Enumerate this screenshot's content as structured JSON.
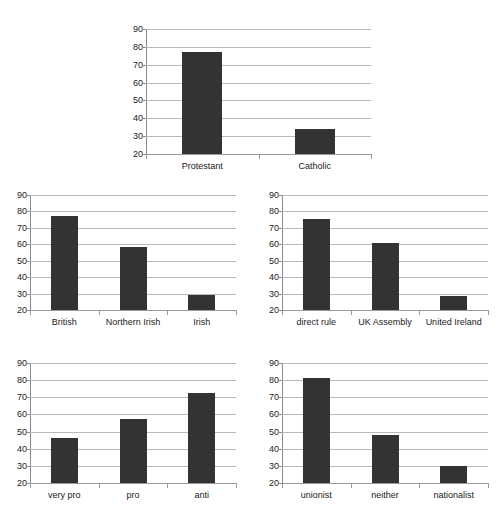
{
  "figure": {
    "background": "#ffffff",
    "bar_color": "#333333",
    "gridline_color": "#b9b9b9",
    "axis_color": "#8a8a8a",
    "panel_count": 5
  },
  "chart_data": [
    {
      "id": "religion",
      "type": "bar",
      "title": "",
      "xlabel": "",
      "ylabel": "",
      "ylim": [
        20,
        90
      ],
      "yticks": [
        20,
        30,
        40,
        50,
        60,
        70,
        80,
        90
      ],
      "grid": true,
      "legend": null,
      "categories": [
        "Protestant",
        "Catholic"
      ],
      "values": [
        77,
        34
      ]
    },
    {
      "id": "national-identity",
      "type": "bar",
      "title": "",
      "xlabel": "",
      "ylabel": "",
      "ylim": [
        20,
        90
      ],
      "yticks": [
        20,
        30,
        40,
        50,
        60,
        70,
        80,
        90
      ],
      "grid": true,
      "legend": null,
      "categories": [
        "British",
        "Northern Irish",
        "Irish"
      ],
      "values": [
        77,
        58.5,
        29
      ]
    },
    {
      "id": "constitutional-preference",
      "type": "bar",
      "title": "",
      "xlabel": "",
      "ylabel": "",
      "ylim": [
        20,
        90
      ],
      "yticks": [
        20,
        30,
        40,
        50,
        60,
        70,
        80,
        90
      ],
      "grid": true,
      "legend": null,
      "categories": [
        "direct rule",
        "UK Assembly",
        "United Ireland"
      ],
      "values": [
        75.5,
        60.5,
        28.5
      ]
    },
    {
      "id": "agreement-stance",
      "type": "bar",
      "title": "",
      "xlabel": "",
      "ylabel": "",
      "ylim": [
        20,
        90
      ],
      "yticks": [
        20,
        30,
        40,
        50,
        60,
        70,
        80,
        90
      ],
      "grid": true,
      "legend": null,
      "categories": [
        "very pro",
        "pro",
        "anti"
      ],
      "values": [
        46,
        57.5,
        72.5
      ]
    },
    {
      "id": "political-alignment",
      "type": "bar",
      "title": "",
      "xlabel": "",
      "ylabel": "",
      "ylim": [
        20,
        90
      ],
      "yticks": [
        20,
        30,
        40,
        50,
        60,
        70,
        80,
        90
      ],
      "grid": true,
      "legend": null,
      "categories": [
        "unionist",
        "neither",
        "nationalist"
      ],
      "values": [
        81,
        48,
        30
      ]
    }
  ],
  "layout": {
    "panels": [
      {
        "chart_index": 0,
        "left": 112,
        "top": 22,
        "width": 268,
        "height": 160,
        "plot_left": 34,
        "plot_right": 9,
        "plot_top": 7,
        "plot_bottom": 28
      },
      {
        "chart_index": 1,
        "left": 4,
        "top": 188,
        "width": 240,
        "height": 160,
        "plot_left": 26,
        "plot_right": 8,
        "plot_top": 7,
        "plot_bottom": 38
      },
      {
        "chart_index": 2,
        "left": 256,
        "top": 188,
        "width": 240,
        "height": 160,
        "plot_left": 26,
        "plot_right": 8,
        "plot_top": 7,
        "plot_bottom": 38
      },
      {
        "chart_index": 3,
        "left": 4,
        "top": 356,
        "width": 240,
        "height": 165,
        "plot_left": 26,
        "plot_right": 8,
        "plot_top": 7,
        "plot_bottom": 38
      },
      {
        "chart_index": 4,
        "left": 256,
        "top": 356,
        "width": 240,
        "height": 165,
        "plot_left": 26,
        "plot_right": 8,
        "plot_top": 7,
        "plot_bottom": 38
      }
    ]
  }
}
